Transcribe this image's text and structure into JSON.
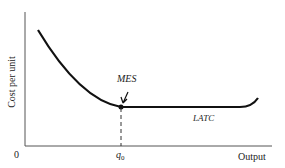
{
  "diagram": {
    "y_axis_label": "Cost per unit",
    "x_axis_label": "Output",
    "origin_label": "0",
    "q_label": "q",
    "q_subscript": "0",
    "mes_label": "MES",
    "curve_label": "LATC"
  }
}
